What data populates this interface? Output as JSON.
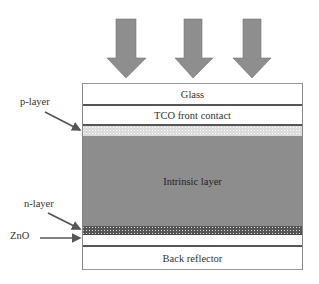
{
  "incident_light": {
    "arrow_count": 3,
    "color": "#8c8c8c"
  },
  "layers": [
    {
      "id": "glass",
      "label": "Glass"
    },
    {
      "id": "tco",
      "label": "TCO front contact"
    },
    {
      "id": "p-layer",
      "label": ""
    },
    {
      "id": "intrinsic",
      "label": "Intrinsic layer"
    },
    {
      "id": "n-layer",
      "label": ""
    },
    {
      "id": "zno",
      "label": ""
    },
    {
      "id": "back-reflector",
      "label": "Back reflector"
    }
  ],
  "callouts": {
    "p_layer": "p-layer",
    "n_layer": "n-layer",
    "zno": "ZnO"
  },
  "colors": {
    "intrinsic": "#8d8d8d",
    "arrow": "#8c8c8c",
    "border": "#555555"
  }
}
